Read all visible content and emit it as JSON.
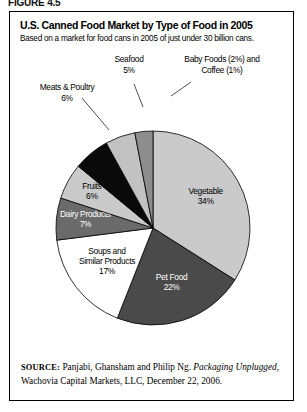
{
  "figure": {
    "label": "FIGURE 4.5"
  },
  "header": {
    "title": "U.S. Canned Food Market by Type of Food in 2005",
    "subtitle": "Based on a market for food cans in 2005 of just under 30 billion cans."
  },
  "source": {
    "label": "SOURCE:",
    "text_before": " Panjabi, Ghansham and Philip Ng. ",
    "italic": "Packaging Unplugged",
    "text_after": ", Wachovia Capital Markets, LLC, December 22, 2006."
  },
  "chart_data": {
    "type": "pie",
    "title": "U.S. Canned Food Market by Type of Food in 2005",
    "subtitle": "Based on a market for food cans in 2005 of just under 30 billion cans.",
    "unit": "percent",
    "start_angle": 0,
    "direction": "clockwise",
    "legend": "none",
    "grid": false,
    "categories": [
      "Vegetable",
      "Pet Food",
      "Soups and Similar Products",
      "Dairy Products",
      "Fruits",
      "Meats & Poultry",
      "Seafood",
      "Baby Foods",
      "Coffee"
    ],
    "values": [
      34,
      22,
      17,
      7,
      6,
      6,
      5,
      2,
      1
    ],
    "slices": [
      {
        "name": "Vegetable",
        "value": 34,
        "label": "Vegetable",
        "percent_label": "34%",
        "color": "#cacaca",
        "text_color": "#000000",
        "placement": "inside"
      },
      {
        "name": "Pet Food",
        "value": 22,
        "label": "Pet Food",
        "percent_label": "22%",
        "color": "#4a4a4a",
        "text_color": "#ffffff",
        "placement": "inside"
      },
      {
        "name": "Soups and Similar Products",
        "value": 17,
        "label": "Soups and Similar Products",
        "label_line1": "Soups and",
        "label_line2": "Similar Products",
        "percent_label": "17%",
        "color": "#ffffff",
        "text_color": "#000000",
        "placement": "inside"
      },
      {
        "name": "Dairy Products",
        "value": 7,
        "label": "Dairy Products",
        "percent_label": "7%",
        "color": "#6a6a6a",
        "text_color": "#ffffff",
        "placement": "inside"
      },
      {
        "name": "Fruits",
        "value": 6,
        "label": "Fruits",
        "percent_label": "6%",
        "color": "#cacaca",
        "text_color": "#000000",
        "placement": "inside"
      },
      {
        "name": "Meats & Poultry",
        "value": 6,
        "label": "Meats & Poultry",
        "percent_label": "6%",
        "color": "#0a0a0a",
        "text_color": "#000000",
        "placement": "outside"
      },
      {
        "name": "Seafood",
        "value": 5,
        "label": "Seafood",
        "percent_label": "5%",
        "color": "#c2c2c2",
        "text_color": "#000000",
        "placement": "outside"
      },
      {
        "name": "Baby Foods and Coffee",
        "value": 3,
        "label": "Baby Foods (2%) and Coffee (1%)",
        "label_line1": "Baby Foods (2%) and",
        "label_line2": "Coffee (1%)",
        "percent_label": "3%",
        "color": "#8d8d8d",
        "text_color": "#000000",
        "placement": "outside"
      }
    ]
  }
}
